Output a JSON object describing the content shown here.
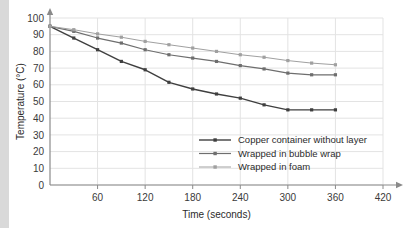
{
  "chart_data": {
    "type": "line",
    "title": "",
    "xlabel": "Time (seconds)",
    "ylabel": "Temperature (°C)",
    "xlim": [
      0,
      420
    ],
    "ylim": [
      0,
      100
    ],
    "xticks": [
      0,
      60,
      120,
      180,
      240,
      300,
      360,
      420
    ],
    "xtick_labels": [
      "0",
      "60",
      "120",
      "180",
      "240",
      "300",
      "360",
      "420"
    ],
    "yticks": [
      0,
      10,
      20,
      30,
      40,
      50,
      60,
      70,
      80,
      90,
      100
    ],
    "ytick_labels": [
      "0",
      "10",
      "20",
      "30",
      "40",
      "50",
      "60",
      "70",
      "80",
      "90",
      "100"
    ],
    "grid": true,
    "legend_position": "inside-lower-right",
    "x": [
      0,
      30,
      60,
      90,
      120,
      150,
      180,
      210,
      240,
      270,
      300,
      330,
      360
    ],
    "series": [
      {
        "name": "Copper container without layer",
        "color": "#3f3f3f",
        "values": [
          95,
          88,
          81,
          74,
          69,
          61.5,
          57.5,
          54.5,
          52,
          48,
          45,
          45,
          45
        ]
      },
      {
        "name": "Wrapped  in bubble wrap",
        "color": "#6e6e6e",
        "values": [
          95,
          92,
          88,
          85,
          81,
          78,
          76,
          74,
          71.5,
          69.5,
          67,
          66,
          66
        ]
      },
      {
        "name": "Wrapped in foam",
        "color": "#a0a0a0",
        "values": [
          95,
          93,
          90.5,
          88.5,
          86,
          84,
          82,
          80,
          78,
          76.5,
          74.5,
          73,
          72
        ]
      }
    ]
  },
  "colors": {
    "grid": "#e3e3e3",
    "axis": "#8a8a8a",
    "text": "#2b2b2b",
    "background": "#ffffff",
    "left_band": "#d9d9d9"
  },
  "legend": {
    "entries": [
      {
        "label": "Copper container without layer"
      },
      {
        "label": "Wrapped  in bubble wrap"
      },
      {
        "label": "Wrapped in foam"
      }
    ]
  }
}
